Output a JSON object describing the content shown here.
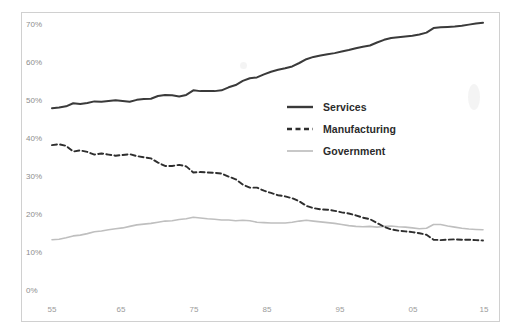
{
  "chart_data": {
    "type": "line",
    "title": "",
    "subtitle": "",
    "xlabel": "",
    "ylabel": "",
    "xlim": [
      1955,
      2016
    ],
    "ylim": [
      0,
      70
    ],
    "grid": false,
    "legend_position": "center-right",
    "y_tick_labels": [
      "0%",
      "10%",
      "20%",
      "30%",
      "40%",
      "50%",
      "60%",
      "70%"
    ],
    "y_tick_values": [
      0,
      10,
      20,
      30,
      40,
      50,
      60,
      70
    ],
    "x_tick_labels": [
      "55",
      "65",
      "75",
      "85",
      "95",
      "05",
      "15"
    ],
    "x_tick_values": [
      1955,
      1965,
      1975,
      1985,
      1995,
      2005,
      2015
    ],
    "x": [
      1955,
      1956,
      1957,
      1958,
      1959,
      1960,
      1961,
      1962,
      1963,
      1964,
      1965,
      1966,
      1967,
      1968,
      1969,
      1970,
      1971,
      1972,
      1973,
      1974,
      1975,
      1976,
      1977,
      1978,
      1979,
      1980,
      1981,
      1982,
      1983,
      1984,
      1985,
      1986,
      1987,
      1988,
      1989,
      1990,
      1991,
      1992,
      1993,
      1994,
      1995,
      1996,
      1997,
      1998,
      1999,
      2000,
      2001,
      2002,
      2003,
      2004,
      2005,
      2006,
      2007,
      2008,
      2009,
      2010,
      2011,
      2012,
      2013,
      2014,
      2015,
      2016
    ],
    "series": [
      {
        "name": "Services",
        "color": "#3a3a3a",
        "style": "solid",
        "width": 2.0,
        "values": [
          48.1,
          48.3,
          48.6,
          49.4,
          49.2,
          49.5,
          49.9,
          49.8,
          50.0,
          50.2,
          50.0,
          49.8,
          50.3,
          50.5,
          50.6,
          51.3,
          51.6,
          51.5,
          51.2,
          51.6,
          52.8,
          52.6,
          52.6,
          52.6,
          52.8,
          53.6,
          54.2,
          55.3,
          56.0,
          56.2,
          57.0,
          57.7,
          58.2,
          58.6,
          59.1,
          60.0,
          61.0,
          61.6,
          62.0,
          62.3,
          62.6,
          63.0,
          63.4,
          63.9,
          64.3,
          64.6,
          65.4,
          66.1,
          66.6,
          66.8,
          67.0,
          67.2,
          67.5,
          68.0,
          69.2,
          69.4,
          69.5,
          69.6,
          69.8,
          70.1,
          70.4,
          70.6
        ]
      },
      {
        "name": "Manufacturing",
        "color": "#2e2e2e",
        "style": "dashed",
        "width": 1.9,
        "values": [
          38.4,
          38.6,
          38.2,
          36.7,
          37.0,
          36.6,
          35.9,
          36.2,
          35.9,
          35.6,
          35.8,
          36.0,
          35.5,
          35.2,
          34.9,
          33.8,
          32.9,
          32.9,
          33.2,
          32.8,
          31.2,
          31.3,
          31.2,
          31.1,
          30.9,
          30.1,
          29.4,
          28.0,
          27.2,
          27.2,
          26.4,
          25.8,
          25.2,
          24.9,
          24.4,
          23.6,
          22.4,
          21.8,
          21.5,
          21.4,
          21.1,
          20.7,
          20.4,
          19.9,
          19.3,
          18.9,
          17.9,
          16.9,
          16.2,
          15.9,
          15.7,
          15.5,
          15.2,
          14.8,
          13.5,
          13.4,
          13.5,
          13.6,
          13.5,
          13.5,
          13.4,
          13.3
        ]
      },
      {
        "name": "Government",
        "color": "#bfbfbf",
        "style": "solid",
        "width": 1.6,
        "values": [
          13.5,
          13.6,
          14.0,
          14.5,
          14.7,
          15.1,
          15.6,
          15.8,
          16.1,
          16.4,
          16.6,
          17.0,
          17.4,
          17.6,
          17.8,
          18.1,
          18.4,
          18.5,
          18.8,
          19.0,
          19.4,
          19.2,
          19.0,
          18.9,
          18.7,
          18.7,
          18.5,
          18.6,
          18.5,
          18.1,
          18.0,
          17.9,
          17.9,
          17.9,
          18.1,
          18.4,
          18.6,
          18.4,
          18.2,
          18.0,
          17.8,
          17.5,
          17.2,
          17.0,
          16.9,
          17.0,
          16.8,
          17.0,
          17.1,
          16.9,
          16.8,
          16.6,
          16.4,
          16.5,
          17.5,
          17.5,
          17.1,
          16.8,
          16.5,
          16.3,
          16.2,
          16.1
        ]
      }
    ]
  },
  "axis": {
    "y_labels": [
      "70%",
      "60%",
      "50%",
      "40%",
      "30%",
      "20%",
      "10%",
      "0%"
    ],
    "x_labels": [
      "55",
      "65",
      "75",
      "85",
      "95",
      "05",
      "15"
    ]
  },
  "legend": {
    "items": [
      {
        "label": "Services",
        "swatch": "solid-line-swatch"
      },
      {
        "label": "Manufacturing",
        "swatch": "dashed-line-swatch"
      },
      {
        "label": "Government",
        "swatch": "light-solid-line-swatch"
      }
    ]
  }
}
